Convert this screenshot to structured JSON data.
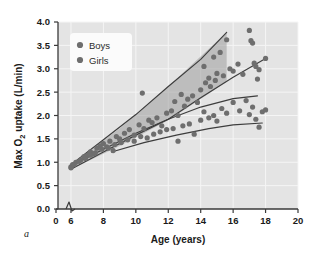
{
  "figure": {
    "panel_label": "a",
    "background_color": "#ffffff",
    "plot_background_color": "#e4e4e4",
    "gridline_color": "#f5f5f5",
    "axis_color": "#3a3a3a",
    "marker_color": "#6e6e6e",
    "band_fill_color": "#9c9c9c",
    "curve_color": "#3d3d3d"
  },
  "chart_data": {
    "type": "scatter",
    "title": "",
    "xlabel": "Age (years)",
    "ylabel": "Max O2 uptake (L/min)",
    "ylabel_parts": {
      "pre": "Max O",
      "sub": "2",
      "post": " uptake (L/min)"
    },
    "xlim": [
      0,
      20
    ],
    "xlim_plot": [
      5.2,
      20
    ],
    "ylim": [
      0.0,
      4.0
    ],
    "xticks": [
      0,
      6,
      8,
      10,
      12,
      14,
      16,
      18,
      20
    ],
    "xtick_labels": [
      "0",
      "6",
      "8",
      "10",
      "12",
      "14",
      "16",
      "18",
      "20"
    ],
    "yticks": [
      0.0,
      0.5,
      1.0,
      1.5,
      2.0,
      2.5,
      3.0,
      3.5,
      4.0
    ],
    "ytick_labels": [
      "0.0",
      "0.5",
      "1.0",
      "1.5",
      "2.0",
      "2.5",
      "3.0",
      "3.5",
      "4.0"
    ],
    "axis_break": {
      "present": true,
      "between": [
        0,
        6
      ],
      "at_x": 3.0
    },
    "grid": true,
    "legend": {
      "position": "top-left-inside",
      "entries": [
        "Boys",
        "Girls"
      ]
    },
    "series": [
      {
        "name": "Boys",
        "marker": "circle",
        "points": [
          [
            6.0,
            0.9
          ],
          [
            6.1,
            0.95
          ],
          [
            6.3,
            1.0
          ],
          [
            6.6,
            1.05
          ],
          [
            6.8,
            1.12
          ],
          [
            7.0,
            1.15
          ],
          [
            7.2,
            1.22
          ],
          [
            7.4,
            1.18
          ],
          [
            7.6,
            1.3
          ],
          [
            7.8,
            1.35
          ],
          [
            8.0,
            1.4
          ],
          [
            8.2,
            1.33
          ],
          [
            8.4,
            1.45
          ],
          [
            8.6,
            1.25
          ],
          [
            8.8,
            1.55
          ],
          [
            9.0,
            1.5
          ],
          [
            9.3,
            1.62
          ],
          [
            9.6,
            1.7
          ],
          [
            9.9,
            1.58
          ],
          [
            10.2,
            1.8
          ],
          [
            10.4,
            2.48
          ],
          [
            10.5,
            1.72
          ],
          [
            10.8,
            1.9
          ],
          [
            11.0,
            1.85
          ],
          [
            11.3,
            1.95
          ],
          [
            11.6,
            1.78
          ],
          [
            11.9,
            2.05
          ],
          [
            12.2,
            2.1
          ],
          [
            12.4,
            2.3
          ],
          [
            12.6,
            2.0
          ],
          [
            12.8,
            2.45
          ],
          [
            13.0,
            2.2
          ],
          [
            13.2,
            2.35
          ],
          [
            13.5,
            2.42
          ],
          [
            13.8,
            2.28
          ],
          [
            14.0,
            2.55
          ],
          [
            14.2,
            3.05
          ],
          [
            14.3,
            2.7
          ],
          [
            14.5,
            2.8
          ],
          [
            14.6,
            2.62
          ],
          [
            14.8,
            3.25
          ],
          [
            14.9,
            2.75
          ],
          [
            15.0,
            2.9
          ],
          [
            15.2,
            3.35
          ],
          [
            15.4,
            2.85
          ],
          [
            15.6,
            3.62
          ],
          [
            15.8,
            3.0
          ],
          [
            16.0,
            2.95
          ],
          [
            16.3,
            3.1
          ],
          [
            16.6,
            2.88
          ],
          [
            17.0,
            3.82
          ],
          [
            17.1,
            3.6
          ],
          [
            17.2,
            3.55
          ],
          [
            17.3,
            3.12
          ],
          [
            17.4,
            3.05
          ],
          [
            17.5,
            2.78
          ],
          [
            17.6,
            2.98
          ],
          [
            18.0,
            3.22
          ]
        ]
      },
      {
        "name": "Girls",
        "marker": "circle",
        "points": [
          [
            6.0,
            0.88
          ],
          [
            6.2,
            0.95
          ],
          [
            6.5,
            1.02
          ],
          [
            6.9,
            1.08
          ],
          [
            7.2,
            1.15
          ],
          [
            7.5,
            1.2
          ],
          [
            7.9,
            1.28
          ],
          [
            8.3,
            1.3
          ],
          [
            8.7,
            1.38
          ],
          [
            9.1,
            1.42
          ],
          [
            9.5,
            1.48
          ],
          [
            9.9,
            1.45
          ],
          [
            10.3,
            1.55
          ],
          [
            10.7,
            1.52
          ],
          [
            11.1,
            1.6
          ],
          [
            11.5,
            1.65
          ],
          [
            11.9,
            1.7
          ],
          [
            12.3,
            1.72
          ],
          [
            12.6,
            1.45
          ],
          [
            12.9,
            1.78
          ],
          [
            13.3,
            1.82
          ],
          [
            13.6,
            1.6
          ],
          [
            14.0,
            1.9
          ],
          [
            14.2,
            2.08
          ],
          [
            14.5,
            1.95
          ],
          [
            14.8,
            2.0
          ],
          [
            15.0,
            1.88
          ],
          [
            15.3,
            2.15
          ],
          [
            15.6,
            2.05
          ],
          [
            16.0,
            2.28
          ],
          [
            16.4,
            2.1
          ],
          [
            16.8,
            2.32
          ],
          [
            17.0,
            2.02
          ],
          [
            17.2,
            2.18
          ],
          [
            17.4,
            1.92
          ],
          [
            17.6,
            1.75
          ],
          [
            17.8,
            2.08
          ],
          [
            18.0,
            2.12
          ]
        ]
      }
    ],
    "band": {
      "name": "boys-envelope",
      "upper": [
        [
          6.0,
          0.95
        ],
        [
          9.0,
          1.72
        ],
        [
          12.0,
          2.62
        ],
        [
          15.6,
          3.78
        ]
      ],
      "lower": [
        [
          6.0,
          0.85
        ],
        [
          9.0,
          1.35
        ],
        [
          12.0,
          1.9
        ],
        [
          15.6,
          2.72
        ],
        [
          18.0,
          3.22
        ]
      ]
    },
    "trend_curves": [
      {
        "name": "boys-upper-trend",
        "points": [
          [
            6.0,
            0.95
          ],
          [
            8.0,
            1.48
          ],
          [
            10.0,
            2.02
          ],
          [
            12.0,
            2.62
          ],
          [
            14.0,
            3.2
          ],
          [
            15.6,
            3.78
          ]
        ]
      },
      {
        "name": "boys-lower-trend",
        "points": [
          [
            6.0,
            0.85
          ],
          [
            8.0,
            1.22
          ],
          [
            10.0,
            1.58
          ],
          [
            12.0,
            1.92
          ],
          [
            14.0,
            2.38
          ],
          [
            16.0,
            2.82
          ],
          [
            18.0,
            3.22
          ]
        ]
      },
      {
        "name": "girls-upper-trend",
        "points": [
          [
            6.0,
            0.92
          ],
          [
            8.0,
            1.28
          ],
          [
            10.0,
            1.62
          ],
          [
            12.0,
            1.92
          ],
          [
            14.0,
            2.18
          ],
          [
            16.0,
            2.36
          ],
          [
            17.5,
            2.42
          ]
        ]
      },
      {
        "name": "girls-lower-trend",
        "points": [
          [
            8.5,
            1.22
          ],
          [
            10.5,
            1.42
          ],
          [
            12.5,
            1.58
          ],
          [
            14.5,
            1.72
          ],
          [
            16.0,
            1.8
          ],
          [
            17.8,
            1.84
          ]
        ]
      }
    ]
  }
}
